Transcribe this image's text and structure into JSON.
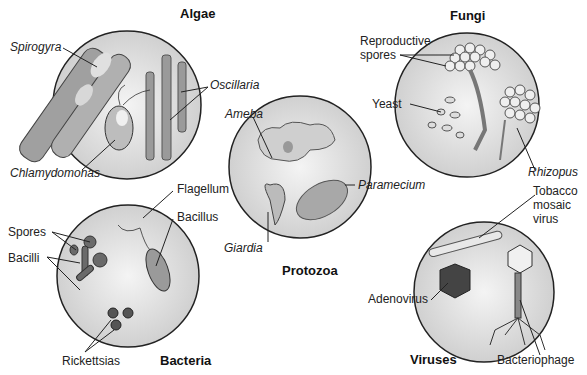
{
  "panels": {
    "algae": {
      "title": "Algae",
      "labels": {
        "spirogyra": "Spirogyra",
        "oscillaria": "Oscillaria",
        "chlamydomonas": "Chlamydomonas"
      }
    },
    "fungi": {
      "title": "Fungi",
      "labels": {
        "reproductive_1": "Reproductive",
        "reproductive_2": "spores",
        "yeast": "Yeast",
        "rhizopus": "Rhizopus"
      }
    },
    "protozoa": {
      "title": "Protozoa",
      "labels": {
        "ameba": "Ameba",
        "paramecium": "Paramecium",
        "giardia": "Giardia"
      }
    },
    "bacteria": {
      "title": "Bacteria",
      "labels": {
        "flagellum": "Flagellum",
        "bacillus": "Bacillus",
        "spores": "Spores",
        "bacilli": "Bacilli",
        "rickettsias": "Rickettsias"
      }
    },
    "viruses": {
      "title": "Viruses",
      "labels": {
        "tmv_1": "Tobacco",
        "tmv_2": "mosaic",
        "tmv_3": "virus",
        "adenovirus": "Adenovirus",
        "bacteriophage": "Bacteriophage"
      }
    }
  },
  "colors": {
    "circle_fill": "#d8d8d8",
    "circle_light": "#f2f2f2",
    "stroke": "#222222",
    "organism": "#9a9a9a",
    "organism_dark": "#5a5a5a"
  }
}
